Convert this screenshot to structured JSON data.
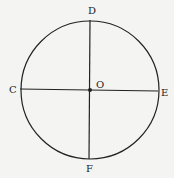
{
  "diagram": {
    "center": {
      "x": 90,
      "y": 90
    },
    "radius": 69,
    "stroke_color": "#222222",
    "background": "#f4f4f2",
    "points": {
      "D": {
        "label": "D",
        "x": 90,
        "y": 20,
        "label_x": 88,
        "label_y": 14
      },
      "C": {
        "label": "C",
        "x": 20,
        "y": 89,
        "label_x": 9,
        "label_y": 93
      },
      "E": {
        "label": "E",
        "x": 158,
        "y": 91,
        "label_x": 161,
        "label_y": 96
      },
      "F": {
        "label": "F",
        "x": 89,
        "y": 159,
        "label_x": 89,
        "label_y": 172
      },
      "O": {
        "label": "O",
        "x": 90,
        "y": 90,
        "label_x": 96,
        "label_y": 88
      }
    },
    "segments": [
      {
        "name": "diameter-DF",
        "from": "D",
        "to": "F"
      },
      {
        "name": "diameter-CE",
        "from": "C",
        "to": "E"
      }
    ]
  }
}
